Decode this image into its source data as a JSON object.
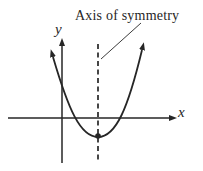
{
  "figure": {
    "background": "#ffffff",
    "ink_color": "#262626",
    "annotation": {
      "label": "Axis of symmetry"
    },
    "axes": {
      "x_label": "x",
      "y_label": "y"
    }
  }
}
